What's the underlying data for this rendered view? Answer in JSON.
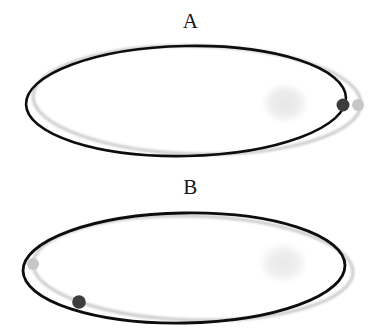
{
  "figure": {
    "title": "",
    "background_color": "#ffffff",
    "width": 381,
    "height": 335,
    "panel_count": 2
  },
  "colors": {
    "orbit_primary": "#0d0d0d",
    "orbit_secondary": "#c9c9c9",
    "marker_dark": "#3d3d3d",
    "marker_light": "#c6c6c6",
    "blob_fill": "#ededed",
    "label_text": "#161616",
    "background": "#ffffff"
  },
  "panels": [
    {
      "id": "panel-a",
      "label": "A",
      "label_position": "top-center",
      "orbits": [
        {
          "name": "primary-orbit",
          "style": "solid-black",
          "color": "#0d0d0d",
          "stroke_width": 2.6,
          "cx": 186,
          "cy": 101,
          "rx": 160,
          "ry": 55,
          "rotation_deg": -1.2
        },
        {
          "name": "secondary-orbit",
          "style": "solid-gray",
          "color": "#c9c9c9",
          "stroke_width": 3.0,
          "cx": 197,
          "cy": 100,
          "rx": 164,
          "ry": 54,
          "rotation_deg": 1.4
        }
      ],
      "blob": {
        "name": "diffuse-cloud",
        "cx": 285,
        "cy": 103,
        "rx": 23,
        "ry": 20,
        "fill": "#ededed"
      },
      "markers": [
        {
          "name": "marker-dark",
          "cx": 343,
          "cy": 105,
          "r": 6.5,
          "fill": "#3d3d3d",
          "on_orbit": "primary-orbit"
        },
        {
          "name": "marker-light",
          "cx": 358,
          "cy": 105,
          "r": 6.0,
          "fill": "#c6c6c6",
          "on_orbit": "secondary-orbit"
        }
      ]
    },
    {
      "id": "panel-b",
      "label": "B",
      "label_position": "top-center",
      "orbits": [
        {
          "name": "primary-orbit",
          "style": "solid-black",
          "color": "#0d0d0d",
          "stroke_width": 2.8,
          "cx": 184,
          "cy": 268,
          "rx": 161,
          "ry": 55,
          "rotation_deg": -1.0
        },
        {
          "name": "secondary-orbit",
          "style": "solid-gray",
          "color": "#c9c9c9",
          "stroke_width": 3.0,
          "cx": 193,
          "cy": 268,
          "rx": 160,
          "ry": 52,
          "rotation_deg": 1.6
        }
      ],
      "blob": {
        "name": "diffuse-cloud",
        "cx": 283,
        "cy": 263,
        "rx": 24,
        "ry": 20,
        "fill": "#ededed"
      },
      "markers": [
        {
          "name": "marker-light",
          "cx": 33,
          "cy": 264,
          "r": 6.0,
          "fill": "#c6c6c6",
          "on_orbit": "secondary-orbit"
        },
        {
          "name": "marker-dark",
          "cx": 79,
          "cy": 302,
          "r": 6.8,
          "fill": "#3d3d3d",
          "on_orbit": "primary-orbit"
        }
      ]
    }
  ]
}
